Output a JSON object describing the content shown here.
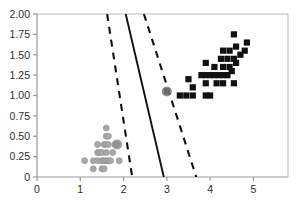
{
  "chart_data": {
    "type": "scatter",
    "title": "",
    "subtitle": "",
    "xlabel": "",
    "ylabel": "",
    "xlim": [
      0,
      5.8
    ],
    "ylim": [
      0,
      2.0
    ],
    "grid": false,
    "legend": "none",
    "x_ticks": [
      0,
      1,
      2,
      3,
      4,
      5
    ],
    "x_tick_labels": [
      "0",
      "1",
      "2",
      "3",
      "4",
      "5"
    ],
    "y_ticks": [
      0,
      0.25,
      0.5,
      0.75,
      1.0,
      1.25,
      1.5,
      1.75,
      2.0
    ],
    "y_tick_labels": [
      "0",
      "0.25",
      "0.50",
      "0.75",
      "1.00",
      "1.25",
      "1.50",
      "1.75",
      "2.00"
    ],
    "axis_color": "#9a9a9a",
    "frame": "top-right-box",
    "series": [
      {
        "name": "class-a",
        "marker": "circle",
        "color": "#a9a9a9",
        "points": [
          [
            1.1,
            0.2
          ],
          [
            1.3,
            0.2
          ],
          [
            1.4,
            0.2
          ],
          [
            1.5,
            0.2
          ],
          [
            1.55,
            0.2
          ],
          [
            1.6,
            0.2
          ],
          [
            1.65,
            0.2
          ],
          [
            1.7,
            0.2
          ],
          [
            1.9,
            0.2
          ],
          [
            1.3,
            0.1
          ],
          [
            1.5,
            0.1
          ],
          [
            1.55,
            0.1
          ],
          [
            1.4,
            0.3
          ],
          [
            1.45,
            0.3
          ],
          [
            1.5,
            0.3
          ],
          [
            1.6,
            0.3
          ],
          [
            1.75,
            0.3
          ],
          [
            1.4,
            0.4
          ],
          [
            1.55,
            0.4
          ],
          [
            1.6,
            0.4
          ],
          [
            1.65,
            0.4
          ],
          [
            1.8,
            0.4
          ],
          [
            1.6,
            0.5
          ],
          [
            1.65,
            0.5
          ],
          [
            1.6,
            0.6
          ],
          [
            1.85,
            0.4
          ]
        ]
      },
      {
        "name": "class-b",
        "marker": "square",
        "color": "#111111",
        "points": [
          [
            3.0,
            1.05
          ],
          [
            3.3,
            1.0
          ],
          [
            3.45,
            1.0
          ],
          [
            3.6,
            1.0
          ],
          [
            3.9,
            1.0
          ],
          [
            4.0,
            1.0
          ],
          [
            3.6,
            1.1
          ],
          [
            3.9,
            1.15
          ],
          [
            4.15,
            1.15
          ],
          [
            4.3,
            1.15
          ],
          [
            4.55,
            1.15
          ],
          [
            3.5,
            1.2
          ],
          [
            3.8,
            1.25
          ],
          [
            3.9,
            1.25
          ],
          [
            4.0,
            1.25
          ],
          [
            4.1,
            1.25
          ],
          [
            4.2,
            1.25
          ],
          [
            4.3,
            1.25
          ],
          [
            4.4,
            1.25
          ],
          [
            4.5,
            1.3
          ],
          [
            4.1,
            1.35
          ],
          [
            4.3,
            1.35
          ],
          [
            4.45,
            1.35
          ],
          [
            4.6,
            1.4
          ],
          [
            3.9,
            1.4
          ],
          [
            4.25,
            1.45
          ],
          [
            4.4,
            1.45
          ],
          [
            4.55,
            1.45
          ],
          [
            4.3,
            1.55
          ],
          [
            4.45,
            1.55
          ],
          [
            4.7,
            1.5
          ],
          [
            4.6,
            1.6
          ],
          [
            4.8,
            1.55
          ],
          [
            4.55,
            1.75
          ],
          [
            4.85,
            1.65
          ]
        ]
      }
    ],
    "lines": [
      {
        "name": "lower-margin",
        "style": "dashed",
        "color": "#111111",
        "x_at_ymax": 1.62,
        "x_at_ymin": 2.2,
        "ymax": 2.0,
        "ymin": 0.0
      },
      {
        "name": "decision-boundary",
        "style": "solid",
        "color": "#111111",
        "x_at_ymax": 2.05,
        "x_at_ymin": 2.93,
        "ymax": 2.0,
        "ymin": 0.0
      },
      {
        "name": "upper-margin",
        "style": "dashed",
        "color": "#111111",
        "x_at_ymax": 2.47,
        "x_at_ymin": 3.68,
        "ymax": 2.0,
        "ymin": 0.0
      }
    ],
    "support_vectors": [
      {
        "name": "support-vector-upper",
        "x": 3.0,
        "y": 1.05,
        "color": "#7a7a7a"
      },
      {
        "name": "support-vector-lower",
        "x": 1.85,
        "y": 0.4,
        "color": "#8f8f8f"
      }
    ]
  }
}
